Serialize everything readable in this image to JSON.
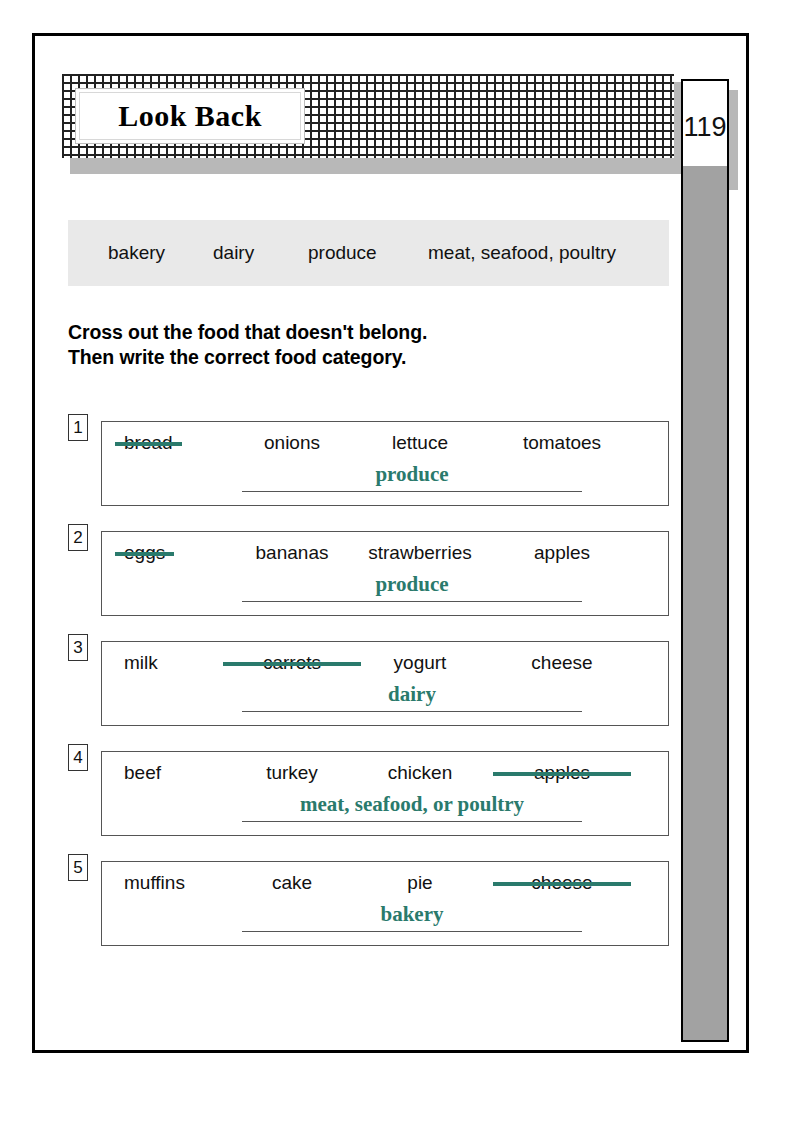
{
  "page": {
    "title": "Look Back",
    "page_number": "119"
  },
  "word_bank": {
    "words": [
      "bakery",
      "dairy",
      "produce",
      "meat, seafood, poultry"
    ]
  },
  "instructions": {
    "line1": "Cross out the food that doesn't belong.",
    "line2": "Then write the correct food category."
  },
  "colors": {
    "answer_teal": "#2a7a6c",
    "word_bank_bg": "#e9e9e9",
    "side_strip": "#a2a2a2"
  },
  "exercises": [
    {
      "number": "1",
      "words": [
        "bread",
        "onions",
        "lettuce",
        "tomatoes"
      ],
      "crossed_index": 0,
      "answer": "produce"
    },
    {
      "number": "2",
      "words": [
        "eggs",
        "bananas",
        "strawberries",
        "apples"
      ],
      "crossed_index": 0,
      "answer": "produce"
    },
    {
      "number": "3",
      "words": [
        "milk",
        "carrots",
        "yogurt",
        "cheese"
      ],
      "crossed_index": 1,
      "answer": "dairy"
    },
    {
      "number": "4",
      "words": [
        "beef",
        "turkey",
        "chicken",
        "apples"
      ],
      "crossed_index": 3,
      "answer": "meat, seafood, or poultry"
    },
    {
      "number": "5",
      "words": [
        "muffins",
        "cake",
        "pie",
        "cheese"
      ],
      "crossed_index": 3,
      "answer": "bakery"
    }
  ]
}
